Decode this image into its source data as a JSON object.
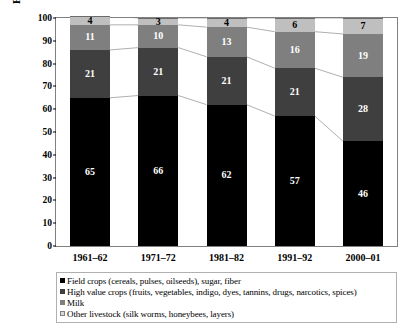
{
  "chart_data": {
    "type": "bar",
    "subtype": "stacked-column-100",
    "title": "",
    "xlabel": "",
    "ylabel": "Percentage value of agricultural output",
    "ylim": [
      0,
      100
    ],
    "ytick_step": 10,
    "yticks": [
      0,
      10,
      20,
      30,
      40,
      50,
      60,
      70,
      80,
      90,
      100
    ],
    "grid": false,
    "legend_position": "bottom",
    "connector_lines": true,
    "categories": [
      "1961–62",
      "1971–72",
      "1981–82",
      "1991–92",
      "2000–01"
    ],
    "series": [
      {
        "name": "Field crops (cereals, pulses, oilseeds), sugar, fiber",
        "color": "#000000",
        "values": [
          65,
          66,
          62,
          57,
          46
        ]
      },
      {
        "name": "High value crops (fruits, vegetables, indigo, dyes, tannins, drugs, narcotics, spices)",
        "color": "#3f3f3f",
        "values": [
          21,
          21,
          21,
          21,
          28
        ]
      },
      {
        "name": "Milk",
        "color": "#7f7f7f",
        "values": [
          11,
          10,
          13,
          16,
          19
        ]
      },
      {
        "name": "Other livestock (silk worms, honeybees, layers)",
        "color": "#bfbfbf",
        "values": [
          4,
          3,
          4,
          6,
          7
        ]
      }
    ]
  },
  "legend": {
    "items": [
      {
        "label": "Field crops (cereals, pulses, oilseeds), sugar, fiber",
        "swatch": "black-square-icon"
      },
      {
        "label": "High value crops (fruits, vegetables, indigo, dyes, tannins, drugs, narcotics, spices)",
        "swatch": "dark-gray-square-icon"
      },
      {
        "label": "Milk",
        "swatch": "mid-gray-square-icon"
      },
      {
        "label": "Other livestock (silk worms, honeybees, layers)",
        "swatch": "light-gray-square-icon"
      }
    ]
  }
}
